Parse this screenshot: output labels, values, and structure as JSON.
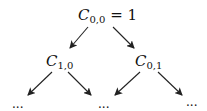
{
  "diagram": {
    "type": "binary-tree",
    "nodes": {
      "root": {
        "symbol": "C",
        "subscript": "0,0",
        "suffix": "= 1"
      },
      "left": {
        "symbol": "C",
        "subscript": "1,0"
      },
      "right": {
        "symbol": "C",
        "subscript": "0,1"
      }
    },
    "leaves": [
      "...",
      "...",
      "..."
    ],
    "edges": [
      {
        "from": "root",
        "to": "left"
      },
      {
        "from": "root",
        "to": "right"
      },
      {
        "from": "left",
        "to": "leaf-1"
      },
      {
        "from": "left",
        "to": "leaf-2"
      },
      {
        "from": "right",
        "to": "leaf-2"
      },
      {
        "from": "right",
        "to": "leaf-3"
      }
    ],
    "colors": {
      "stroke": "#222222",
      "text": "#111111",
      "background": "#ffffff"
    }
  }
}
